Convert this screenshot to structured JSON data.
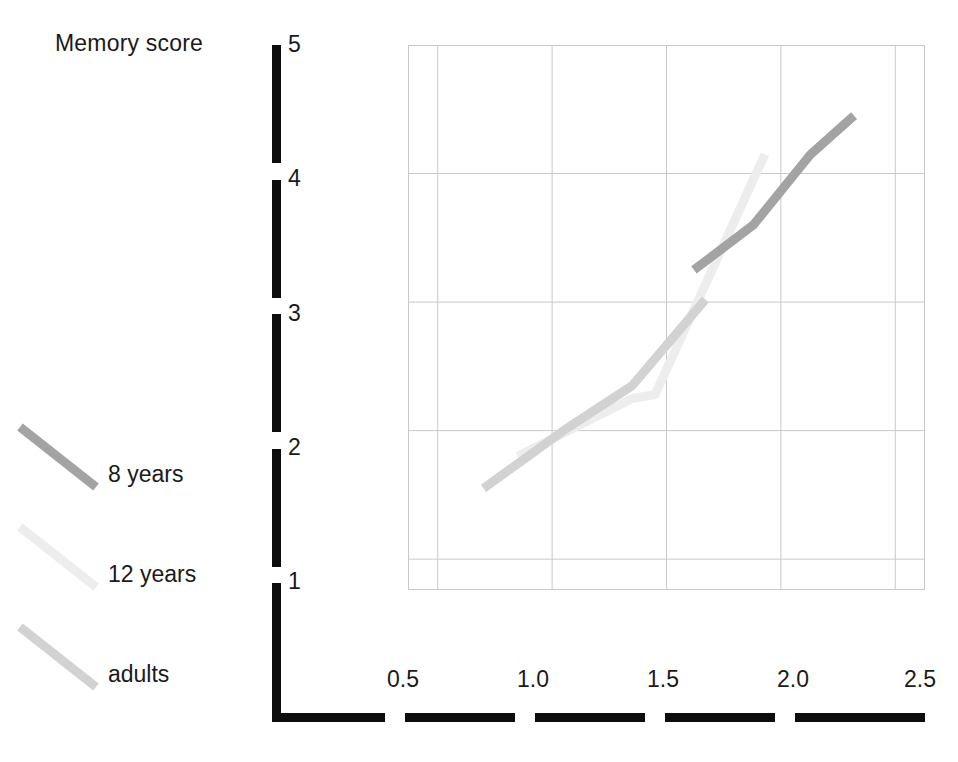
{
  "chart_data": {
    "type": "line",
    "title": "",
    "ylabel": "Memory score",
    "xlabel": "",
    "xlim": [
      0.37,
      2.63
    ],
    "ylim": [
      0.76,
      5.0
    ],
    "grid": true,
    "legend_position": "left-outside",
    "x_ticks": [
      "0.5",
      "1.0",
      "1.5",
      "2.0",
      "2.5"
    ],
    "x_tick_values": [
      0.5,
      1.0,
      1.5,
      2.0,
      2.5
    ],
    "y_ticks": [
      "1",
      "2",
      "3",
      "4",
      "5"
    ],
    "y_tick_values": [
      1,
      2,
      3,
      4,
      5
    ],
    "series": [
      {
        "name": "8 years",
        "color": "#a3a3a3",
        "x": [
          1.62,
          1.88,
          2.13,
          2.32
        ],
        "values": [
          3.25,
          3.6,
          4.15,
          4.45
        ]
      },
      {
        "name": "12 years",
        "color": "#ededed",
        "x": [
          0.85,
          1.35,
          1.45,
          1.93
        ],
        "values": [
          1.8,
          2.25,
          2.28,
          4.15
        ]
      },
      {
        "name": "adults",
        "color": "#d2d2d2",
        "x": [
          0.7,
          1.05,
          1.35,
          1.67
        ],
        "values": [
          1.55,
          2.0,
          2.35,
          3.02
        ]
      }
    ]
  },
  "axes": {
    "y_title": "Memory score",
    "y_tick_labels": [
      "5",
      "4",
      "3",
      "2",
      "1"
    ],
    "x_tick_labels": [
      "0.5",
      "1.0",
      "1.5",
      "2.0",
      "2.5"
    ],
    "axis_color": "#0d0d0d",
    "grid_color": "#c9c9c9"
  },
  "legend": {
    "items": [
      {
        "label": "8 years",
        "color": "#a3a3a3"
      },
      {
        "label": "12 years",
        "color": "#ededed"
      },
      {
        "label": "adults",
        "color": "#d2d2d2"
      }
    ]
  }
}
